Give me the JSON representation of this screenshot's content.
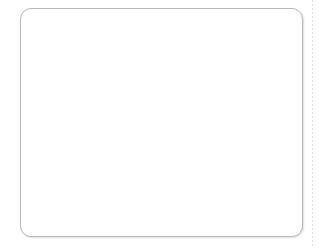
{
  "scene": {
    "title": "Counting comparison worksheet panel",
    "background_color": "#ffffff",
    "panel": {
      "name": "worksheet-panel",
      "x": 20,
      "y": 8,
      "width": 283,
      "height": 229,
      "fill": "#ffffff",
      "border_color": "#b9b9b9",
      "border_radius": 11
    },
    "artifact": {
      "name": "scan-edge-line",
      "x": 312,
      "color": "#d8d8d8"
    }
  },
  "groups": [
    {
      "id": "circles",
      "label": "circle-group",
      "shape": "circle",
      "count": 14,
      "fill": "#6f6f6f",
      "stroke": "#5d5d5d",
      "shadow": "#696969",
      "items": [
        {
          "x": 52,
          "y": 37,
          "size": 19
        },
        {
          "x": 80,
          "y": 30,
          "size": 19
        },
        {
          "x": 114,
          "y": 29,
          "size": 19
        },
        {
          "x": 141,
          "y": 31,
          "size": 19
        },
        {
          "x": 74,
          "y": 50,
          "size": 19
        },
        {
          "x": 95,
          "y": 48,
          "size": 19
        },
        {
          "x": 131,
          "y": 50,
          "size": 19
        },
        {
          "x": 53,
          "y": 63,
          "size": 19
        },
        {
          "x": 88,
          "y": 68,
          "size": 19
        },
        {
          "x": 112,
          "y": 71,
          "size": 19
        },
        {
          "x": 143,
          "y": 73,
          "size": 19
        },
        {
          "x": 69,
          "y": 83,
          "size": 19
        },
        {
          "x": 98,
          "y": 90,
          "size": 19
        }
      ]
    },
    {
      "id": "squares",
      "label": "square-group",
      "shape": "square",
      "count": 8,
      "fill": "#9d9d9d",
      "stroke": "#8a8a8a",
      "shadow": "#828282",
      "items": [
        {
          "x": 203,
          "y": 37,
          "size": 18
        },
        {
          "x": 232,
          "y": 31,
          "size": 18
        },
        {
          "x": 256,
          "y": 38,
          "size": 18
        },
        {
          "x": 187,
          "y": 60,
          "size": 18
        },
        {
          "x": 218,
          "y": 59,
          "size": 18
        },
        {
          "x": 243,
          "y": 64,
          "size": 18
        },
        {
          "x": 199,
          "y": 87,
          "size": 18
        },
        {
          "x": 228,
          "y": 88,
          "size": 18
        }
      ]
    }
  ]
}
